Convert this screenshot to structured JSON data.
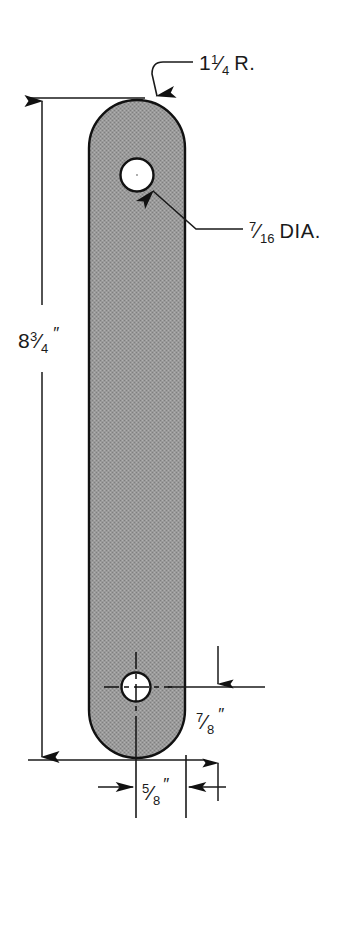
{
  "drawing": {
    "title": "Flat bar link with two holes",
    "type": "engineering-dimensioned-part-drawing",
    "background_color": "#ffffff",
    "part": {
      "name": "flat-bar-link",
      "shape": "stadium",
      "fill_color": "#999999",
      "outline_color": "#111111",
      "hatch_style": "dithered-gray"
    },
    "holes": [
      {
        "name": "upper-hole",
        "fill_color": "#ffffff",
        "label": "7/16 DIA."
      },
      {
        "name": "lower-hole",
        "fill_color": "#ffffff",
        "has_centerlines": true
      }
    ],
    "annotations": {
      "corner_radius": {
        "whole": "1",
        "frac_num": "1",
        "frac_den": "4",
        "suffix": "R.",
        "full_text": "1 1/4 R."
      },
      "hole_diameter": {
        "whole": "",
        "frac_num": "7",
        "frac_den": "16",
        "suffix": "DIA.",
        "full_text": "7/16 DIA."
      },
      "overall_length": {
        "whole": "8",
        "frac_num": "3",
        "frac_den": "4",
        "inch_mark": "″",
        "full_text": "8 3/4 \""
      },
      "hole_to_end": {
        "whole": "",
        "frac_num": "7",
        "frac_den": "8",
        "inch_mark": "″",
        "full_text": "7/8 \""
      },
      "hole_to_edge": {
        "whole": "",
        "frac_num": "5",
        "frac_den": "8",
        "inch_mark": "″",
        "full_text": "5/8 \""
      }
    },
    "line_color": "#1a1a1a"
  }
}
